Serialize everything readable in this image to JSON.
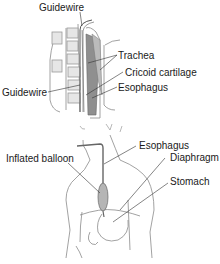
{
  "diagram": {
    "top_panel": {
      "labels": {
        "guidewire_top": "Guidewire",
        "trachea": "Trachea",
        "cricoid": "Cricoid cartilage",
        "guidewire_left": "Guidewire",
        "esophagus": "Esophagus"
      }
    },
    "bottom_panel": {
      "labels": {
        "esophagus": "Esophagus",
        "inflated_balloon": "Inflated balloon",
        "diaphragm": "Diaphragm",
        "stomach": "Stomach"
      }
    },
    "colors": {
      "line": "#8a8a8a",
      "leader": "#333333",
      "fill_dark": "#9a9a9a",
      "fill_light": "#d9d9d9",
      "balloon": "#b5b5b5"
    }
  }
}
